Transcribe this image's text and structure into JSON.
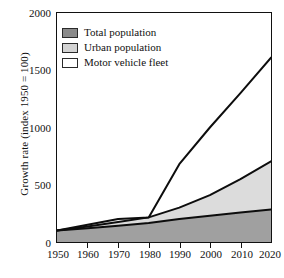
{
  "chart_data": {
    "type": "area",
    "title": "",
    "xlabel": "",
    "ylabel": "Growth rate (index 1950 = 100)",
    "xlim": [
      1950,
      2020
    ],
    "ylim": [
      0,
      2000
    ],
    "grid": false,
    "legend_position": "top-left",
    "xticks": [
      "1950",
      "1960",
      "1970",
      "1980",
      "1990",
      "2000",
      "2010",
      "2020"
    ],
    "yticks": [
      "0",
      "500",
      "1000",
      "1500",
      "2000"
    ],
    "x": [
      1950,
      1960,
      1970,
      1980,
      1990,
      2000,
      2010,
      2020
    ],
    "series": [
      {
        "name": "Total population",
        "color": "#a0a0a0",
        "values": [
          100,
          120,
          143,
          165,
          200,
          230,
          258,
          285
        ]
      },
      {
        "name": "Urban population",
        "color": "#dcdcdc",
        "values": [
          100,
          135,
          175,
          215,
          300,
          410,
          550,
          705
        ]
      },
      {
        "name": "Motor vehicle fleet",
        "color": "#ffffff",
        "values": [
          100,
          150,
          200,
          215,
          680,
          1000,
          1300,
          1610
        ]
      }
    ]
  },
  "legend": {
    "items": [
      {
        "label": "Total population",
        "swatch": "#8a8a8a"
      },
      {
        "label": "Urban population",
        "swatch": "#d3d3d3"
      },
      {
        "label": "Motor vehicle fleet",
        "swatch": "#ffffff"
      }
    ]
  },
  "colors": {
    "axis": "#111111",
    "line": "#0d0d0d",
    "total_population_fill": "#a0a0a0",
    "urban_population_fill": "#dcdcdc",
    "motor_vehicle_fill": "#ffffff",
    "background": "#ffffff"
  }
}
